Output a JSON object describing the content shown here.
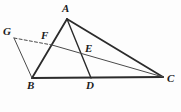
{
  "figure": {
    "kind": "geometry-diagram",
    "width": 181,
    "height": 112,
    "background_color": "#fdfdfd",
    "stroke_color": "#2b2b2b",
    "thin_stroke_color": "#4a4a4a",
    "label_color": "#1b1b1b"
  },
  "points": {
    "A": {
      "label": "A",
      "x": 67,
      "y": 19,
      "label_x": 62,
      "label_y": 3
    },
    "B": {
      "label": "B",
      "x": 32,
      "y": 78,
      "label_x": 27,
      "label_y": 80
    },
    "C": {
      "label": "C",
      "x": 163,
      "y": 77,
      "label_x": 167,
      "label_y": 73
    },
    "D": {
      "label": "D",
      "x": 91,
      "y": 78,
      "label_x": 86,
      "label_y": 80
    },
    "E": {
      "label": "E",
      "x": 83,
      "y": 57,
      "label_x": 85,
      "label_y": 43
    },
    "F": {
      "label": "F",
      "x": 52,
      "y": 45,
      "label_x": 41,
      "label_y": 30
    },
    "G": {
      "label": "G",
      "x": 14,
      "y": 38,
      "label_x": 3,
      "label_y": 26
    }
  },
  "segments": [
    {
      "name": "segment-AB",
      "from": "A",
      "to": "B",
      "style": "solid",
      "width": 1.8
    },
    {
      "name": "segment-AC",
      "from": "A",
      "to": "C",
      "style": "solid",
      "width": 1.8
    },
    {
      "name": "segment-AD",
      "from": "A",
      "to": "D",
      "style": "solid",
      "width": 1.4
    },
    {
      "name": "segment-BC",
      "from": "B",
      "to": "C",
      "style": "solid",
      "width": 2.0
    },
    {
      "name": "segment-GB",
      "from": "G",
      "to": "B",
      "style": "solid",
      "width": 1.0
    },
    {
      "name": "segment-GF",
      "from": "G",
      "to": "F",
      "style": "dashed",
      "width": 1.0
    },
    {
      "name": "segment-FC",
      "from": "F",
      "to": "C",
      "style": "solid",
      "width": 1.0
    }
  ]
}
